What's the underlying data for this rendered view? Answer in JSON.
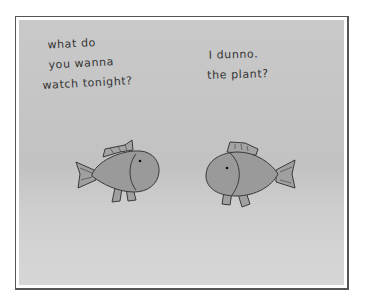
{
  "comic": {
    "left_fish": {
      "lines": [
        "what do",
        "you wanna",
        "watch tonight?"
      ]
    },
    "right_fish": {
      "lines": [
        "I dunno.",
        "the plant?"
      ]
    },
    "colors": {
      "fish_fill": "#9a9a9a",
      "fish_outline": "#3a3a3a",
      "water": "#c6c6c6",
      "border": "#555555"
    }
  }
}
